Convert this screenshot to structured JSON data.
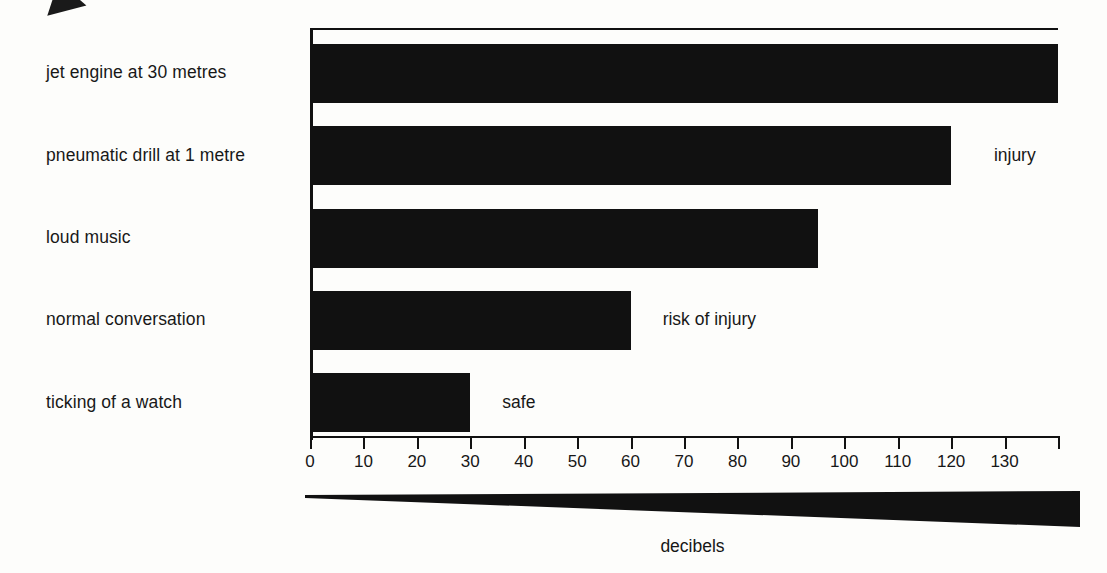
{
  "chart_data": {
    "type": "bar",
    "orientation": "horizontal",
    "title": "",
    "xlabel": "decibels",
    "ylabel": "",
    "categories": [
      "jet engine at 30 metres",
      "pneumatic drill at 1 metre",
      "loud music",
      "normal conversation",
      "ticking of a watch"
    ],
    "values": [
      140,
      120,
      95,
      60,
      30
    ],
    "xlim": [
      0,
      140
    ],
    "tick_labels": [
      "0",
      "10",
      "20",
      "30",
      "40",
      "50",
      "60",
      "70",
      "80",
      "90",
      "100",
      "110",
      "120",
      "130"
    ],
    "tick_values": [
      0,
      10,
      20,
      30,
      40,
      50,
      60,
      70,
      80,
      90,
      100,
      110,
      120,
      130
    ],
    "grid": false,
    "legend": "none",
    "bar_color": "#111111",
    "background_color": "#fdfdfb",
    "annotations": [
      {
        "text": "injury",
        "category": "pneumatic drill at 1 metre",
        "value_position": 128
      },
      {
        "text": "risk of injury",
        "category": "normal conversation",
        "value_position": 66
      },
      {
        "text": "safe",
        "category": "ticking of a watch",
        "value_position": 36
      }
    ]
  },
  "axis": {
    "caption": "decibels"
  },
  "decor": {
    "arrow_artifact": "arrow-artifact",
    "wedge": "gradient-wedge"
  }
}
